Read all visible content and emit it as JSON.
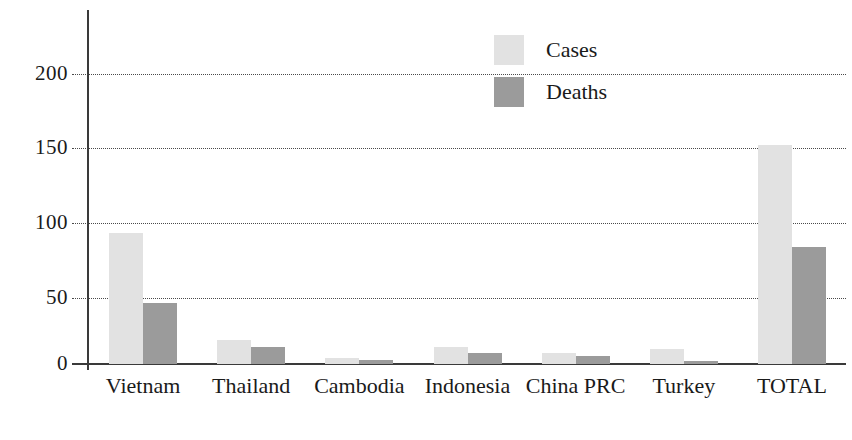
{
  "chart_data": {
    "type": "bar",
    "title": "",
    "subtitle": "",
    "xlabel": "",
    "ylabel": "",
    "categories": [
      "Vietnam",
      "Thailand",
      "Cambodia",
      "Indonesia",
      "China PRC",
      "Turkey",
      "TOTAL"
    ],
    "series": [
      {
        "name": "Cases",
        "color": "#e2e2e2",
        "values": [
          93,
          17,
          4,
          12,
          8,
          11,
          155
        ]
      },
      {
        "name": "Deaths",
        "color": "#9b9b9b",
        "values": [
          43,
          12,
          3,
          8,
          6,
          2,
          83
        ]
      }
    ],
    "ylim": [
      0,
      215
    ],
    "yticks": [
      0,
      50,
      100,
      150,
      200
    ],
    "ytick_labels": [
      "0",
      "50",
      "100",
      "150",
      "200"
    ],
    "grid": true,
    "grid_style": "dotted",
    "legend_position": "top-center-right",
    "legend_entries": [
      "Cases",
      "Deaths"
    ],
    "annotations": []
  },
  "axis": {
    "y_tick_labels": [
      "200",
      "150",
      "100",
      "50",
      "0"
    ]
  },
  "legend": {
    "items": [
      {
        "label": "Cases"
      },
      {
        "label": "Deaths"
      }
    ]
  }
}
